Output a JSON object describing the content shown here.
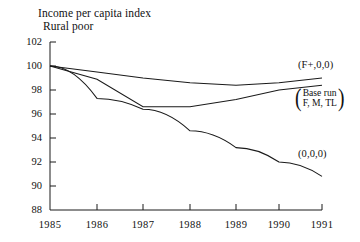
{
  "chart_data": {
    "type": "line",
    "title": "Income per capita index",
    "subtitle": "Rural poor",
    "xlabel": "",
    "ylabel": "",
    "xlim": [
      1985,
      1991
    ],
    "ylim": [
      88,
      102
    ],
    "grid": false,
    "legend_position": "inline-right-annotations",
    "x": [
      1985,
      1986,
      1987,
      1988,
      1989,
      1990,
      1991
    ],
    "xticklabels": [
      "1985",
      "1986",
      "1987",
      "1988",
      "1989",
      "1990",
      "1991"
    ],
    "yticks": [
      88,
      90,
      92,
      94,
      96,
      98,
      100,
      102
    ],
    "yticklabels": [
      "88",
      "90",
      "92",
      "94",
      "96",
      "98",
      "100",
      "102"
    ],
    "series": [
      {
        "name": "(F+,0,0)",
        "label": "(F+,0,0)",
        "values": [
          100.0,
          99.5,
          99.0,
          98.6,
          98.4,
          98.6,
          99.0
        ]
      },
      {
        "name": "Base run (F,M,TL)",
        "label": "Base run",
        "label_line2": "F, M, TL",
        "values": [
          100.0,
          98.9,
          96.6,
          96.6,
          97.2,
          98.0,
          98.4
        ]
      },
      {
        "name": "(0,0,0)",
        "label": "(0,0,0)",
        "values": [
          100.0,
          97.3,
          96.4,
          94.6,
          93.2,
          92.0,
          90.8
        ]
      }
    ]
  },
  "annotations": {
    "f_plus": "(F+,0,0)",
    "base_run_line1": "Base run",
    "base_run_line2": "F, M, TL",
    "zero": "(0,0,0)"
  },
  "colors": {
    "line": "#1a1a1a",
    "axis": "#1a1a1a",
    "background": "#ffffff",
    "text": "#111111"
  }
}
